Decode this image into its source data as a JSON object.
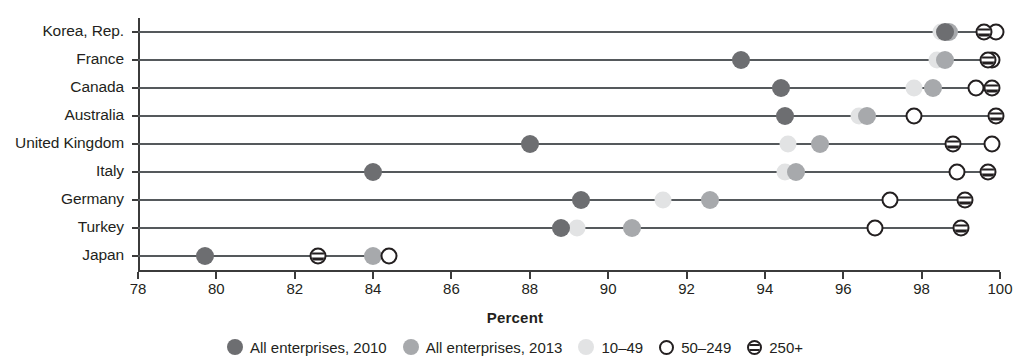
{
  "chart_data": {
    "type": "scatter",
    "title": "",
    "xlabel": "Percent",
    "ylabel": "",
    "xlim": [
      78,
      100
    ],
    "xticks": [
      78,
      80,
      82,
      84,
      86,
      88,
      90,
      92,
      94,
      96,
      98,
      100
    ],
    "grid": false,
    "legend_position": "bottom",
    "categories": [
      "Korea, Rep.",
      "France",
      "Canada",
      "Australia",
      "United Kingdom",
      "Italy",
      "Germany",
      "Turkey",
      "Japan"
    ],
    "series": [
      {
        "name": "All enterprises, 2010",
        "marker": "filled-circle",
        "color": "#6d6e71",
        "values": [
          98.6,
          93.4,
          94.4,
          94.5,
          88.0,
          84.0,
          89.3,
          88.8,
          79.7
        ]
      },
      {
        "name": "All enterprises, 2013",
        "marker": "filled-circle",
        "color": "#a7a9ac",
        "values": [
          98.7,
          98.6,
          98.3,
          96.6,
          95.4,
          94.8,
          92.6,
          90.6,
          84.0
        ]
      },
      {
        "name": "10–49",
        "marker": "filled-circle",
        "color": "#e2e3e4",
        "values": [
          98.5,
          98.4,
          97.8,
          96.4,
          94.6,
          94.5,
          91.4,
          89.2,
          null
        ]
      },
      {
        "name": "50–249",
        "marker": "open-circle",
        "color": "#ffffff",
        "values": [
          99.9,
          99.8,
          99.4,
          97.8,
          99.8,
          98.9,
          97.2,
          96.8,
          84.4
        ]
      },
      {
        "name": "250+",
        "marker": "striped-circle",
        "color": "#ffffff",
        "values": [
          99.6,
          99.7,
          99.8,
          99.9,
          98.8,
          99.7,
          99.1,
          99.0,
          82.6
        ]
      }
    ]
  },
  "legend": {
    "items": [
      {
        "label": "All enterprises, 2010",
        "swatch": "filled-dark-circle-icon"
      },
      {
        "label": "All enterprises, 2013",
        "swatch": "filled-medium-circle-icon"
      },
      {
        "label": "10–49",
        "swatch": "filled-light-circle-icon"
      },
      {
        "label": "50–249",
        "swatch": "open-circle-icon"
      },
      {
        "label": "250+",
        "swatch": "striped-circle-icon"
      }
    ]
  }
}
